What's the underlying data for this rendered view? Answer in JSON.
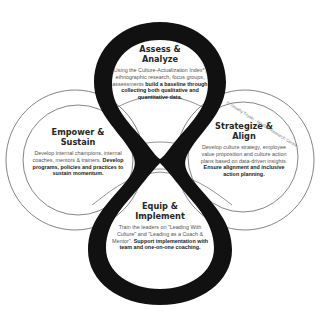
{
  "diagram": {
    "colors": {
      "loop": "#111111",
      "outline": "#555555",
      "background": "#ffffff",
      "text_title": "#262626",
      "text_body": "#555555"
    },
    "stages": [
      {
        "id": "assess",
        "title_line1": "Assess &",
        "title_line2": "Analyze",
        "desc_plain": "Using the Culture-Actualization Index*, ethnographic research, focus groups, assessments",
        "desc_bold": "build a baseline through collecting both qualitative and quantitative data."
      },
      {
        "id": "strategize",
        "title_line1": "Strategize &",
        "title_line2": "Align",
        "desc_plain": "Develop culture strategy, employee value proposition and culture action plans based on data-driven insights.",
        "desc_bold": "Ensure alignment and inclusive action planning."
      },
      {
        "id": "equip",
        "title_line1": "Equip &",
        "title_line2": "Implement",
        "desc_plain": "Train the leaders on \"Leading With Culture\" and \"Leading as a Coach & Mentor\".",
        "desc_bold": "Support implementation with team and one-on-one coaching."
      },
      {
        "id": "empower",
        "title_line1": "Empower &",
        "title_line2": "Sustain",
        "desc_plain": "Develop internal champions, internal coaches, mentors & trainers.",
        "desc_bold": "Develop programs, policies and practices to sustain momentum."
      }
    ],
    "copyright": "© Timothy Tiryaki - Maslow Research Centre"
  }
}
